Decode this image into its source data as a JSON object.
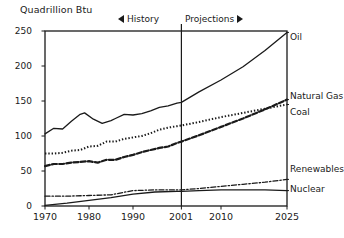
{
  "chart_data": {
    "type": "line",
    "title": "",
    "ylabel": "Quadrillion Btu",
    "xlabel": "",
    "xlim": [
      1970,
      2025
    ],
    "ylim": [
      0,
      250
    ],
    "grid": false,
    "legend_position": "right-inline",
    "yticks": [
      0,
      50,
      100,
      150,
      200,
      250
    ],
    "xticks": [
      1970,
      1980,
      1990,
      2001,
      2010,
      2025
    ],
    "annotations": [
      {
        "text": "History",
        "marker": "left-arrow",
        "x_range": [
          1970,
          2001
        ]
      },
      {
        "text": "Projections",
        "marker": "right-arrow",
        "x_range": [
          2001,
          2025
        ]
      },
      {
        "text": "divider",
        "x": 2001
      }
    ],
    "series": [
      {
        "name": "Oil",
        "style": "solid",
        "x": [
          1970,
          1972,
          1974,
          1976,
          1978,
          1979,
          1981,
          1983,
          1985,
          1986,
          1988,
          1990,
          1992,
          1994,
          1996,
          1998,
          2000,
          2001,
          2005,
          2010,
          2015,
          2020,
          2025
        ],
        "values": [
          103,
          111,
          110,
          121,
          131,
          133,
          124,
          118,
          122,
          125,
          131,
          130,
          132,
          136,
          141,
          143,
          147,
          148,
          163,
          180,
          199,
          222,
          248
        ]
      },
      {
        "name": "Natural Gas",
        "style": "dashed",
        "x": [
          1970,
          1972,
          1974,
          1976,
          1978,
          1980,
          1982,
          1984,
          1986,
          1988,
          1990,
          1992,
          1994,
          1996,
          1998,
          2000,
          2001,
          2005,
          2010,
          2015,
          2020,
          2025
        ],
        "values": [
          57,
          60,
          60,
          62,
          63,
          64,
          62,
          66,
          66,
          70,
          73,
          77,
          80,
          83,
          85,
          90,
          92,
          101,
          113,
          125,
          138,
          152
        ]
      },
      {
        "name": "Coal",
        "style": "dotted",
        "x": [
          1970,
          1972,
          1974,
          1976,
          1978,
          1980,
          1982,
          1984,
          1986,
          1988,
          1990,
          1992,
          1994,
          1996,
          1998,
          2000,
          2001,
          2005,
          2010,
          2015,
          2020,
          2025
        ],
        "values": [
          75,
          75,
          76,
          79,
          80,
          85,
          86,
          92,
          92,
          96,
          98,
          100,
          104,
          109,
          112,
          114,
          115,
          120,
          127,
          133,
          139,
          145
        ]
      },
      {
        "name": "Renewables",
        "style": "dash-dot",
        "x": [
          1970,
          1975,
          1980,
          1985,
          1990,
          1995,
          2000,
          2001,
          2005,
          2010,
          2015,
          2020,
          2025
        ],
        "values": [
          14,
          14,
          15,
          16,
          22,
          23,
          23,
          23,
          25,
          28,
          31,
          34,
          38
        ]
      },
      {
        "name": "Nuclear",
        "style": "solid",
        "x": [
          1970,
          1975,
          1980,
          1985,
          1990,
          1995,
          2000,
          2001,
          2005,
          2010,
          2015,
          2020,
          2025
        ],
        "values": [
          1,
          4,
          8,
          12,
          17,
          20,
          21,
          21,
          22,
          23,
          23,
          23,
          22
        ]
      }
    ]
  },
  "axis": {
    "y_title": "Quadrillion Btu",
    "y_ticks": [
      "0",
      "50",
      "100",
      "150",
      "200",
      "250"
    ],
    "x_ticks": [
      "1970",
      "1980",
      "1990",
      "2001",
      "2010",
      "2025"
    ]
  },
  "period_markers": {
    "history_label": "History",
    "projections_label": "Projections",
    "left_arrow_icon": "left-arrow-icon",
    "right_arrow_icon": "right-arrow-icon"
  },
  "series_labels": {
    "oil": "Oil",
    "natural_gas": "Natural Gas",
    "coal": "Coal",
    "renewables": "Renewables",
    "nuclear": "Nuclear"
  },
  "colors": {
    "ink": "#1a1a1a",
    "background": "#ffffff"
  }
}
